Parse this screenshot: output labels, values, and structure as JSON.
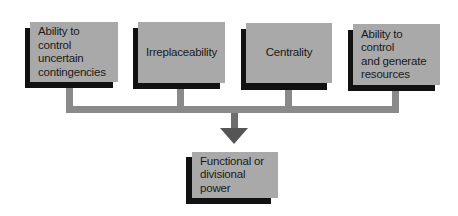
{
  "diagram": {
    "type": "flow",
    "colors": {
      "box_face": "#a9a9a9",
      "box_shadow": "#111111",
      "connector": "#8a8a8a",
      "arrowhead": "#555555",
      "text": "#1a1a1a"
    },
    "sources": [
      {
        "id": "uncertainty",
        "label": "Ability to control\nuncertain\ncontingencies"
      },
      {
        "id": "irreplaceability",
        "label": "Irreplaceability"
      },
      {
        "id": "centrality",
        "label": "Centrality"
      },
      {
        "id": "resources",
        "label": "Ability to control\nand generate\nresources"
      }
    ],
    "target": {
      "id": "power",
      "label": "Functional or\ndivisional power"
    },
    "edges": [
      {
        "from": "uncertainty",
        "to": "power"
      },
      {
        "from": "irreplaceability",
        "to": "power"
      },
      {
        "from": "centrality",
        "to": "power"
      },
      {
        "from": "resources",
        "to": "power"
      }
    ]
  }
}
